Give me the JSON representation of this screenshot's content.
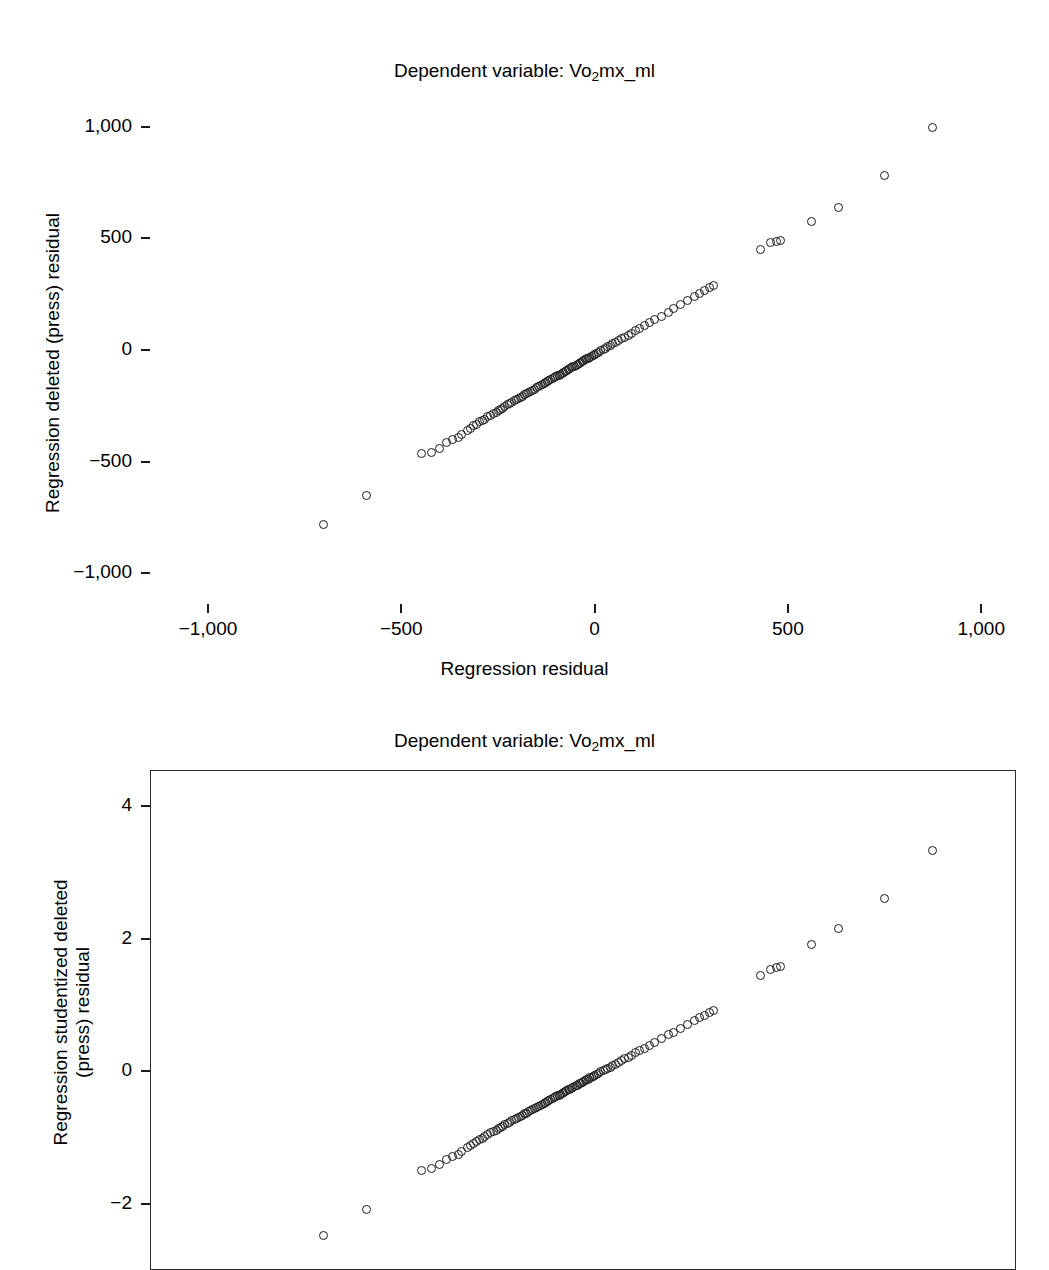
{
  "figure": {
    "background": "#ffffff",
    "marker_color": "#1b1b1b",
    "marker_shape": "open-circle"
  },
  "charts": [
    {
      "id": "regression-deleted-press-residual",
      "title_prefix": "Dependent variable: Vo",
      "title_sub": "2",
      "title_suffix": "mx_ml",
      "title_full": "Dependent variable: Vo2mx_ml",
      "ylabel_line1": "Regression deleted (press) residual",
      "ylabel_line2": "",
      "xlabel": "Regression residual",
      "frame": false
    },
    {
      "id": "regression-studentized-deleted-press-residual",
      "title_prefix": "Dependent variable: Vo",
      "title_sub": "2",
      "title_suffix": "mx_ml",
      "title_full": "Dependent variable: Vo2mx_ml",
      "ylabel_line1": "Regression studentized deleted",
      "ylabel_line2": "(press) residual",
      "xlabel": "",
      "frame": true
    }
  ],
  "chart_data": [
    {
      "type": "scatter",
      "title": "Dependent variable: Vo2mx_ml",
      "xlabel": "Regression residual",
      "ylabel": "Regression deleted (press) residual",
      "xlim": [
        -1150,
        1090
      ],
      "ylim": [
        -1120,
        1120
      ],
      "xticks": [
        -1000,
        -500,
        0,
        500,
        1000
      ],
      "xticklabels": [
        "−1,000",
        "−500",
        "0",
        "500",
        "1,000"
      ],
      "yticks": [
        -1000,
        -500,
        0,
        500,
        1000
      ],
      "yticklabels": [
        "−1,000",
        "−500",
        "0",
        "500",
        "1,000"
      ],
      "grid": false,
      "legend": null,
      "x": [
        -700,
        -590,
        -447,
        -423,
        -400,
        -383,
        -368,
        -352,
        -345,
        -330,
        -322,
        -312,
        -305,
        -297,
        -290,
        -285,
        -277,
        -268,
        -262,
        -255,
        -248,
        -243,
        -238,
        -232,
        -226,
        -220,
        -215,
        -208,
        -202,
        -198,
        -192,
        -187,
        -181,
        -176,
        -170,
        -165,
        -160,
        -155,
        -150,
        -145,
        -140,
        -135,
        -130,
        -126,
        -122,
        -118,
        -113,
        -108,
        -104,
        -100,
        -96,
        -92,
        -88,
        -84,
        -80,
        -76,
        -72,
        -68,
        -64,
        -60,
        -56,
        -52,
        -48,
        -44,
        -40,
        -36,
        -32,
        -28,
        -24,
        -20,
        -16,
        -12,
        -8,
        -4,
        0,
        5,
        10,
        16,
        22,
        28,
        34,
        40,
        47,
        54,
        62,
        70,
        78,
        87,
        96,
        106,
        117,
        129,
        142,
        156,
        172,
        190,
        205,
        222,
        240,
        258,
        272,
        285,
        298,
        307,
        430,
        455,
        470,
        482,
        560,
        630,
        750,
        875
      ],
      "y": [
        -780,
        -650,
        -465,
        -460,
        -440,
        -415,
        -400,
        -390,
        -378,
        -360,
        -350,
        -340,
        -332,
        -322,
        -315,
        -310,
        -300,
        -292,
        -285,
        -278,
        -270,
        -265,
        -260,
        -252,
        -246,
        -240,
        -236,
        -228,
        -222,
        -218,
        -212,
        -207,
        -200,
        -196,
        -190,
        -185,
        -180,
        -175,
        -170,
        -165,
        -160,
        -155,
        -150,
        -146,
        -142,
        -138,
        -133,
        -128,
        -124,
        -120,
        -116,
        -112,
        -108,
        -104,
        -100,
        -96,
        -92,
        -88,
        -84,
        -80,
        -76,
        -72,
        -68,
        -64,
        -60,
        -56,
        -52,
        -48,
        -44,
        -40,
        -36,
        -32,
        -28,
        -24,
        -20,
        -15,
        -10,
        -4,
        2,
        8,
        14,
        20,
        27,
        34,
        42,
        50,
        58,
        67,
        76,
        86,
        97,
        109,
        122,
        136,
        152,
        170,
        185,
        202,
        220,
        238,
        252,
        265,
        278,
        287,
        450,
        480,
        487,
        492,
        575,
        640,
        780,
        995
      ]
    },
    {
      "type": "scatter",
      "title": "Dependent variable: Vo2mx_ml",
      "xlabel": "",
      "ylabel": "Regression studentized deleted (press) residual",
      "xlim": [
        -1150,
        1090
      ],
      "ylim": [
        -3.0,
        4.55
      ],
      "xticks": [],
      "xticklabels": [],
      "yticks": [
        4,
        2,
        0,
        -2
      ],
      "yticklabels": [
        "4",
        "2",
        "0",
        "−2"
      ],
      "grid": false,
      "legend": null,
      "x": [
        -700,
        -590,
        -447,
        -423,
        -400,
        -383,
        -368,
        -352,
        -345,
        -330,
        -322,
        -312,
        -305,
        -297,
        -290,
        -285,
        -277,
        -268,
        -262,
        -255,
        -248,
        -243,
        -238,
        -232,
        -226,
        -220,
        -215,
        -208,
        -202,
        -198,
        -192,
        -187,
        -181,
        -176,
        -170,
        -165,
        -160,
        -155,
        -150,
        -145,
        -140,
        -135,
        -130,
        -126,
        -122,
        -118,
        -113,
        -108,
        -104,
        -100,
        -96,
        -92,
        -88,
        -84,
        -80,
        -76,
        -72,
        -68,
        -64,
        -60,
        -56,
        -52,
        -48,
        -44,
        -40,
        -36,
        -32,
        -28,
        -24,
        -20,
        -16,
        -12,
        -8,
        -4,
        0,
        5,
        10,
        16,
        22,
        28,
        34,
        40,
        47,
        54,
        62,
        70,
        78,
        87,
        96,
        106,
        117,
        129,
        142,
        156,
        172,
        190,
        205,
        222,
        240,
        258,
        272,
        285,
        298,
        307,
        430,
        455,
        470,
        482,
        560,
        630,
        750,
        875
      ],
      "y": [
        -2.48,
        -2.08,
        -1.49,
        -1.47,
        -1.41,
        -1.33,
        -1.28,
        -1.25,
        -1.21,
        -1.15,
        -1.12,
        -1.09,
        -1.06,
        -1.03,
        -1.01,
        -0.99,
        -0.96,
        -0.93,
        -0.91,
        -0.89,
        -0.86,
        -0.85,
        -0.83,
        -0.81,
        -0.79,
        -0.77,
        -0.75,
        -0.73,
        -0.71,
        -0.7,
        -0.68,
        -0.66,
        -0.64,
        -0.63,
        -0.61,
        -0.59,
        -0.58,
        -0.56,
        -0.54,
        -0.53,
        -0.51,
        -0.5,
        -0.48,
        -0.47,
        -0.45,
        -0.44,
        -0.43,
        -0.41,
        -0.4,
        -0.38,
        -0.37,
        -0.36,
        -0.35,
        -0.33,
        -0.32,
        -0.31,
        -0.29,
        -0.28,
        -0.27,
        -0.26,
        -0.24,
        -0.23,
        -0.22,
        -0.21,
        -0.19,
        -0.18,
        -0.17,
        -0.15,
        -0.14,
        -0.13,
        -0.12,
        -0.1,
        -0.09,
        -0.08,
        -0.06,
        -0.05,
        -0.03,
        -0.01,
        0.01,
        0.03,
        0.05,
        0.06,
        0.09,
        0.11,
        0.13,
        0.16,
        0.19,
        0.21,
        0.24,
        0.28,
        0.31,
        0.35,
        0.39,
        0.44,
        0.49,
        0.55,
        0.59,
        0.65,
        0.71,
        0.77,
        0.81,
        0.85,
        0.89,
        0.92,
        1.44,
        1.54,
        1.57,
        1.59,
        1.92,
        2.16,
        2.61,
        3.33
      ]
    }
  ]
}
